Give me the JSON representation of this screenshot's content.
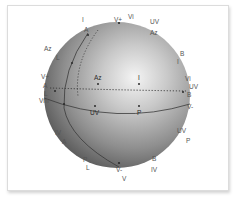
{
  "figure": {
    "type": "sphere-diagram",
    "colors": {
      "sphere_highlight": "#f2f2f2",
      "sphere_mid": "#a8a8a8",
      "sphere_shadow": "#4a4a4a",
      "line": "#3a3a3a",
      "label": "#555555",
      "frame_border": "#dcdcdc"
    },
    "outer_labels": [
      {
        "id": "top-I",
        "text": "I"
      },
      {
        "id": "top-A",
        "text": "A"
      },
      {
        "id": "top-Vplus",
        "text": "V+"
      },
      {
        "id": "top-Vi",
        "text": "Vi"
      },
      {
        "id": "top-UV",
        "text": "UV"
      },
      {
        "id": "top-Az",
        "text": "Az"
      },
      {
        "id": "left-Az",
        "text": "Az"
      },
      {
        "id": "left-L",
        "text": "L"
      },
      {
        "id": "left-Vplus",
        "text": "V+"
      },
      {
        "id": "left-A",
        "text": "A"
      },
      {
        "id": "left-L2",
        "text": "L"
      },
      {
        "id": "left-Vm",
        "text": "Vm"
      },
      {
        "id": "left-IV",
        "text": "IV"
      },
      {
        "id": "left-A2",
        "text": "A"
      },
      {
        "id": "right-B",
        "text": "B"
      },
      {
        "id": "right-I",
        "text": "I"
      },
      {
        "id": "right-Vi",
        "text": "Vi"
      },
      {
        "id": "right-UV",
        "text": "UV"
      },
      {
        "id": "right-B2",
        "text": "B"
      },
      {
        "id": "right-Vminus",
        "text": "V-"
      },
      {
        "id": "right-UV2",
        "text": "UV"
      },
      {
        "id": "right-P",
        "text": "P"
      },
      {
        "id": "bottom-P",
        "text": "P"
      },
      {
        "id": "bottom-L",
        "text": "L"
      },
      {
        "id": "bottom-Vminus",
        "text": "V-"
      },
      {
        "id": "bottom-V",
        "text": "V"
      },
      {
        "id": "bottom-B",
        "text": "B"
      },
      {
        "id": "bottom-IV",
        "text": "IV"
      }
    ],
    "inner_labels": [
      {
        "id": "inner-Az",
        "text": "Az"
      },
      {
        "id": "inner-I",
        "text": "I"
      },
      {
        "id": "inner-UV",
        "text": "UV"
      },
      {
        "id": "inner-P",
        "text": "P"
      }
    ]
  }
}
